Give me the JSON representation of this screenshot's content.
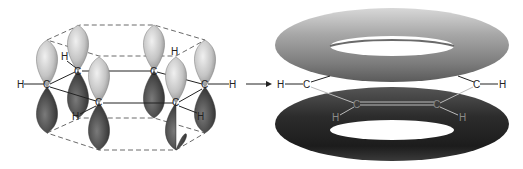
{
  "diagram": {
    "left_panel": {
      "name": "p-orbital overlap",
      "atoms": [
        {
          "label": "C",
          "x": 47,
          "y": 87
        },
        {
          "label": "C",
          "x": 78,
          "y": 71
        },
        {
          "label": "C",
          "x": 99,
          "y": 103
        },
        {
          "label": "C",
          "x": 154,
          "y": 71
        },
        {
          "label": "C",
          "x": 176,
          "y": 103
        },
        {
          "label": "C",
          "x": 205,
          "y": 87
        }
      ],
      "hydrogens": [
        {
          "label": "H",
          "x": 20,
          "y": 87
        },
        {
          "label": "H",
          "x": 64,
          "y": 57
        },
        {
          "label": "H",
          "x": 75,
          "y": 116
        },
        {
          "label": "H",
          "x": 174,
          "y": 51
        },
        {
          "label": "H",
          "x": 233,
          "y": 87
        },
        {
          "label": "H",
          "x": 200,
          "y": 116
        }
      ]
    },
    "arrow": {
      "direction": "right"
    },
    "right_panel": {
      "name": "pi electron rings",
      "atoms": [
        {
          "label": "C",
          "x": 307,
          "y": 87
        },
        {
          "label": "C",
          "x": 357,
          "y": 105
        },
        {
          "label": "C",
          "x": 437,
          "y": 105
        },
        {
          "label": "C",
          "x": 477,
          "y": 87
        }
      ],
      "hydrogens": [
        {
          "label": "H",
          "x": 281,
          "y": 87
        },
        {
          "label": "H",
          "x": 335,
          "y": 117
        },
        {
          "label": "H",
          "x": 462,
          "y": 117
        },
        {
          "label": "H",
          "x": 503,
          "y": 87
        }
      ]
    },
    "colors": {
      "upper_lobe": "#c8c8c8",
      "lower_lobe": "#4a4a4a",
      "upper_ring": "#9a9a9a",
      "lower_ring": "#2a2a2a",
      "dash": "#6a6a6a"
    }
  }
}
